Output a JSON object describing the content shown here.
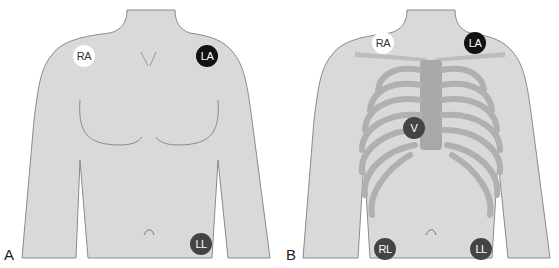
{
  "figure": {
    "colors": {
      "skin": "#d9d9d9",
      "outline": "#8a8a8a",
      "ribs": "#b0b0b0",
      "electrode_white": "#ffffff",
      "electrode_black": "#111111",
      "electrode_dark": "#444444"
    },
    "panels": [
      {
        "label": "A",
        "electrodes": [
          {
            "label": "RA",
            "style": "white"
          },
          {
            "label": "LA",
            "style": "black"
          },
          {
            "label": "LL",
            "style": "dark"
          }
        ]
      },
      {
        "label": "B",
        "electrodes": [
          {
            "label": "RA",
            "style": "white"
          },
          {
            "label": "LA",
            "style": "black"
          },
          {
            "label": "V",
            "style": "dark"
          },
          {
            "label": "RL",
            "style": "dark"
          },
          {
            "label": "LL",
            "style": "dark"
          }
        ]
      }
    ]
  }
}
